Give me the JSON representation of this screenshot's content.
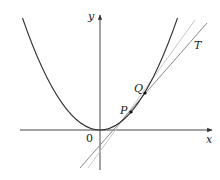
{
  "diagram": {
    "labels": {
      "x_axis": "x",
      "y_axis": "y",
      "origin": "0",
      "point_p": "P",
      "point_q": "Q",
      "tangent": "T"
    },
    "colors": {
      "axis": "#333333",
      "curve": "#333333",
      "tangent": "#8a8a8a",
      "secant": "#c8c8c8",
      "point": "#111111"
    },
    "geometry": {
      "curve": "parabola y = x^2 (vertex at origin)",
      "points": [
        {
          "name": "P",
          "px": 131,
          "py": 112
        },
        {
          "name": "Q",
          "px": 145,
          "py": 93
        }
      ],
      "lines": [
        {
          "name": "T",
          "kind": "tangent at P",
          "from": [
            80,
            168
          ],
          "to": [
            207,
            23
          ]
        },
        {
          "name": "PQ",
          "kind": "secant through P and Q",
          "from": [
            88,
            168
          ],
          "to": [
            195,
            20
          ]
        }
      ]
    }
  }
}
